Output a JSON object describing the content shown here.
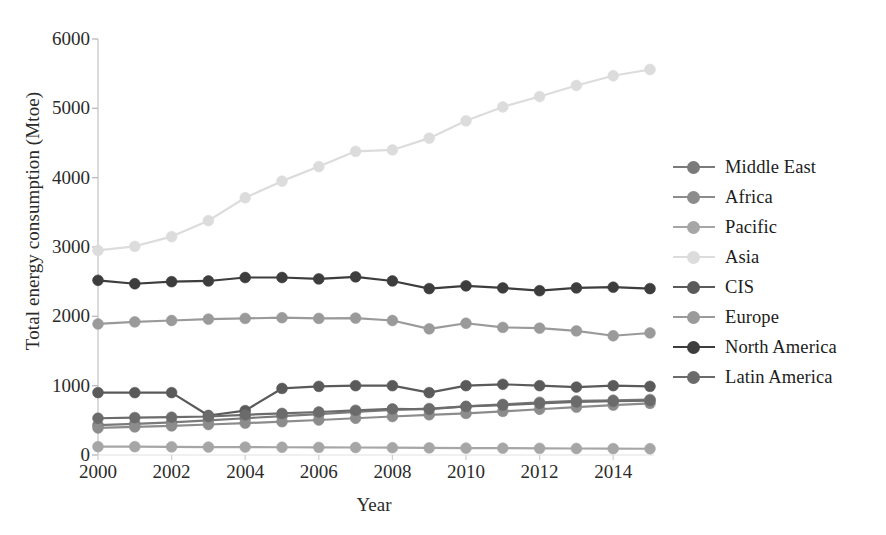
{
  "chart_data": {
    "type": "line",
    "title": "",
    "xlabel": "Year",
    "ylabel": "Total energy consumption (Mtoe)",
    "x": [
      2000,
      2001,
      2002,
      2003,
      2004,
      2005,
      2006,
      2007,
      2008,
      2009,
      2010,
      2011,
      2012,
      2013,
      2014,
      2015
    ],
    "xlim": [
      2000,
      2015
    ],
    "ylim": [
      0,
      6000
    ],
    "xticks": [
      "2000",
      "2002",
      "2004",
      "2006",
      "2008",
      "2010",
      "2012",
      "2014"
    ],
    "xtick_values": [
      2000,
      2002,
      2004,
      2006,
      2008,
      2010,
      2012,
      2014
    ],
    "yticks": [
      "0",
      "1000",
      "2000",
      "3000",
      "4000",
      "5000",
      "6000"
    ],
    "ytick_values": [
      0,
      1000,
      2000,
      3000,
      4000,
      5000,
      6000
    ],
    "grid": false,
    "legend_position": "right",
    "marker": "circle",
    "series": [
      {
        "name": "Middle East",
        "color": "#7a7a7a",
        "values": [
          430,
          450,
          470,
          500,
          530,
          560,
          590,
          620,
          650,
          670,
          700,
          730,
          760,
          780,
          790,
          800
        ]
      },
      {
        "name": "Africa",
        "color": "#8c8c8c",
        "values": [
          390,
          405,
          420,
          440,
          460,
          480,
          505,
          530,
          555,
          580,
          600,
          630,
          660,
          690,
          720,
          745
        ]
      },
      {
        "name": "Pacific",
        "color": "#a6a6a6",
        "values": [
          120,
          120,
          118,
          115,
          115,
          112,
          110,
          108,
          105,
          103,
          100,
          98,
          96,
          94,
          92,
          90
        ]
      },
      {
        "name": "Asia",
        "color": "#dcdcdc",
        "values": [
          2950,
          3010,
          3150,
          3380,
          3710,
          3950,
          4160,
          4380,
          4400,
          4570,
          4820,
          5020,
          5170,
          5330,
          5470,
          5560
        ]
      },
      {
        "name": "CIS",
        "color": "#5a5a5a",
        "values": [
          900,
          900,
          900,
          570,
          640,
          960,
          990,
          1000,
          1000,
          900,
          1000,
          1020,
          1000,
          980,
          1000,
          990
        ]
      },
      {
        "name": "Europe",
        "color": "#9a9a9a",
        "values": [
          1890,
          1920,
          1940,
          1960,
          1970,
          1980,
          1970,
          1975,
          1940,
          1820,
          1900,
          1840,
          1830,
          1790,
          1720,
          1760
        ]
      },
      {
        "name": "North America",
        "color": "#3d3d3d",
        "values": [
          2520,
          2470,
          2500,
          2510,
          2560,
          2560,
          2540,
          2570,
          2510,
          2400,
          2440,
          2410,
          2370,
          2410,
          2420,
          2400
        ]
      },
      {
        "name": "Latin America",
        "color": "#6b6b6b",
        "values": [
          530,
          540,
          545,
          555,
          580,
          600,
          620,
          645,
          665,
          660,
          700,
          720,
          745,
          765,
          775,
          785
        ]
      }
    ]
  },
  "legend": {
    "items": [
      {
        "label": "Middle East"
      },
      {
        "label": "Africa"
      },
      {
        "label": "Pacific"
      },
      {
        "label": "Asia"
      },
      {
        "label": "CIS"
      },
      {
        "label": "Europe"
      },
      {
        "label": "North America"
      },
      {
        "label": "Latin America"
      }
    ]
  }
}
